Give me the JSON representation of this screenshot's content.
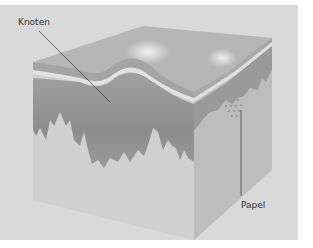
{
  "figure": {
    "type": "skin-cross-section-diagram",
    "labels": [
      {
        "id": "knoten",
        "text": "Knoten"
      },
      {
        "id": "papel",
        "text": "Papel"
      }
    ],
    "colors": {
      "background_panel": "#d9d9d9",
      "page": "#ffffff",
      "surface_top": "#b5b5b5",
      "epidermis_band": "#a3a3a3",
      "light_band": "#e0e0e0",
      "dermis_dark": "#8f8f8f",
      "dermis_mid": "#a8a8a8",
      "subcutis": "#cfcfcf",
      "side_face": "#b9b9b9",
      "leader_line": "#333333"
    }
  }
}
